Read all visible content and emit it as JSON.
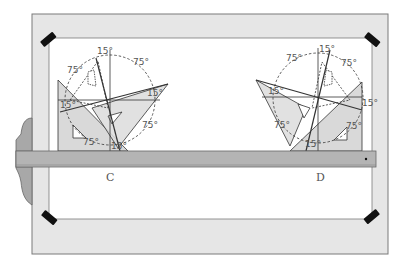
{
  "figure": {
    "labels": {
      "left": "C",
      "right": "D"
    },
    "angles": {
      "a15": "15°",
      "a75": "75°"
    },
    "colors": {
      "board": "#e6e6e6",
      "board_edge": "#7a7a7a",
      "paper": "#ffffff",
      "tsquare": "#b4b4b4",
      "triangle": "#d9d9d9",
      "tape": "#111111",
      "line": "#333333"
    }
  }
}
